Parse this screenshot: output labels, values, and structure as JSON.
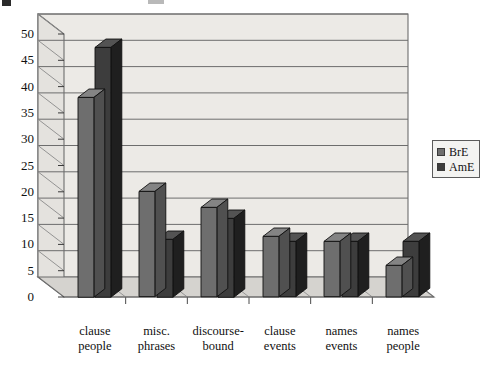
{
  "chart_data": {
    "type": "bar",
    "title": "",
    "subtitle": "",
    "xlabel": "",
    "ylabel": "",
    "categories": [
      "clause\npeople",
      "misc.\nphrases",
      "discourse-\nbound",
      "clause\nevents",
      "names\nevents",
      "names\npeople"
    ],
    "category_lines": [
      [
        "clause",
        "people"
      ],
      [
        "misc.",
        "phrases"
      ],
      [
        "discourse-",
        "bound"
      ],
      [
        "clause",
        "events"
      ],
      [
        "names",
        "events"
      ],
      [
        "names",
        "people"
      ]
    ],
    "series": [
      {
        "name": "BrE",
        "color": "#6e6e6e",
        "values": [
          38,
          20,
          17,
          11.5,
          10.5,
          6
        ]
      },
      {
        "name": "AmE",
        "color": "#3d3d3d",
        "values": [
          47.5,
          11,
          15,
          10.5,
          10.5,
          10.5
        ]
      }
    ],
    "ylim": [
      0,
      50
    ],
    "yticks": [
      0,
      5,
      10,
      15,
      20,
      25,
      30,
      35,
      40,
      45,
      50
    ],
    "ytick_labels": [
      "0",
      "5",
      "10",
      "15",
      "20",
      "25",
      "30",
      "35",
      "40",
      "45",
      "50"
    ],
    "grid": true,
    "grid_axis": "y",
    "legend_position": "right",
    "three_d": true,
    "plot_background": "#eceae6",
    "frame_color": "#6d6d6d"
  },
  "legend": {
    "entries": [
      {
        "label": "BrE",
        "swatch_color": "#6e6e6e"
      },
      {
        "label": "AmE",
        "swatch_color": "#3d3d3d"
      }
    ]
  },
  "figure": {
    "background": "#ffffff"
  }
}
